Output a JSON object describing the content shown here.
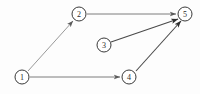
{
  "diagram": {
    "type": "directed-graph",
    "background_color": "#fdfdfd",
    "node_fill": "#ffffff",
    "node_stroke": "#3a3a3a",
    "label_color": "#2b2b2b",
    "node_radius": 7,
    "nodes": [
      {
        "id": "1",
        "label": "1",
        "cx": 22,
        "cy": 77
      },
      {
        "id": "2",
        "label": "2",
        "cx": 79,
        "cy": 14
      },
      {
        "id": "3",
        "label": "3",
        "cx": 104,
        "cy": 45
      },
      {
        "id": "4",
        "label": "4",
        "cx": 129,
        "cy": 77
      },
      {
        "id": "5",
        "label": "5",
        "cx": 185,
        "cy": 14
      }
    ],
    "edges": [
      {
        "id": "e1-2",
        "from": "1",
        "to": "2",
        "x1": 28,
        "y1": 71,
        "x2": 73,
        "y2": 21,
        "color": "#8d8d8d",
        "width": 0.9,
        "arrow": true
      },
      {
        "id": "e1-4",
        "from": "1",
        "to": "4",
        "x1": 30,
        "y1": 77,
        "x2": 120,
        "y2": 77,
        "color": "#7d7d7d",
        "width": 1.0,
        "arrow": true
      },
      {
        "id": "e2-5",
        "from": "2",
        "to": "5",
        "x1": 87,
        "y1": 14,
        "x2": 176,
        "y2": 14,
        "color": "#7d7d7d",
        "width": 1.0,
        "arrow": true
      },
      {
        "id": "e3-5",
        "from": "3",
        "to": "5",
        "x1": 111,
        "y1": 42,
        "x2": 178,
        "y2": 19,
        "color": "#4a4a4a",
        "width": 1.1,
        "arrow": true
      },
      {
        "id": "e4-5",
        "from": "4",
        "to": "5",
        "x1": 136,
        "y1": 71,
        "x2": 181,
        "y2": 21,
        "color": "#4a4a4a",
        "width": 1.1,
        "arrow": true
      }
    ]
  }
}
